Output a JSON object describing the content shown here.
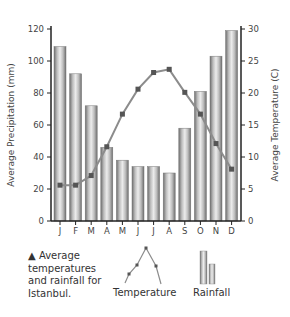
{
  "chart_data": {
    "type": "bar+line",
    "title": "",
    "categories": [
      "J",
      "F",
      "M",
      "A",
      "M",
      "J",
      "J",
      "A",
      "S",
      "O",
      "N",
      "D"
    ],
    "series": [
      {
        "name": "Rainfall",
        "type": "bar",
        "axis": "left",
        "values": [
          109,
          92,
          72,
          46,
          38,
          34,
          34,
          30,
          58,
          81,
          103,
          119
        ]
      },
      {
        "name": "Temperature",
        "type": "line",
        "axis": "right",
        "values": [
          5.6,
          5.6,
          7.1,
          11.6,
          16.7,
          20.6,
          23.2,
          23.7,
          20.1,
          16.7,
          12.1,
          8.1
        ]
      }
    ],
    "xlabel": "",
    "ylabel": "Average Precipitation (mm)",
    "ylabel_right": "Average Temperature (C)",
    "ylim": [
      0,
      120
    ],
    "ylim_right": [
      0,
      30
    ],
    "yticks": [
      0,
      20,
      40,
      60,
      80,
      100,
      120
    ],
    "yticks_right": [
      0,
      5,
      10,
      15,
      20,
      25,
      30
    ],
    "grid": false,
    "legend": {
      "position": "bottom",
      "entries": [
        "Temperature",
        "Rainfall"
      ]
    }
  },
  "caption": {
    "marker": "▲",
    "lines": [
      "Average",
      "temperatures",
      "and rainfall for",
      "Istanbul."
    ]
  },
  "legend": {
    "temperature_label": "Temperature",
    "rainfall_label": "Rainfall"
  },
  "colors": {
    "bar_dark": "#7a7a7a",
    "bar_light": "#e6e6e6",
    "line": "#8c8c8c",
    "marker": "#555555",
    "axis": "#222222"
  }
}
